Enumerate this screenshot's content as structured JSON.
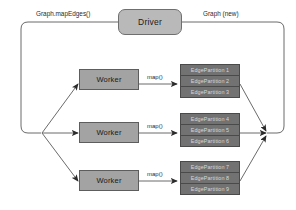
{
  "diagram": {
    "driver": {
      "label": "Driver"
    },
    "edge_labels": {
      "graph_in": "Graph.mapEdges()",
      "graph_out": "Graph (new)",
      "map_1": "map()",
      "map_2": "map()",
      "map_3": "map()"
    },
    "workers": [
      {
        "label": "Worker"
      },
      {
        "label": "Worker"
      },
      {
        "label": "Worker"
      }
    ],
    "partition_stacks": [
      {
        "rows": [
          "EdgePartition 1",
          "EdgePartition 2",
          "EdgePartition 3"
        ]
      },
      {
        "rows": [
          "EdgePartition 4",
          "EdgePartition 5",
          "EdgePartition 6"
        ]
      },
      {
        "rows": [
          "EdgePartition 7",
          "EdgePartition 8",
          "EdgePartition 9"
        ]
      }
    ],
    "colors": {
      "driver_fill": "#b9b9b9",
      "worker_fill": "#a3a3a3",
      "partition_fill": "#6e6e6e",
      "partition_text": "#d8d8d8",
      "stroke": "#5d5d5d",
      "line": "#6b6b6b",
      "background": "#ffffff"
    }
  }
}
